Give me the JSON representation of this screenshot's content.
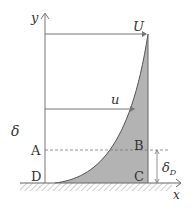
{
  "diagram": {
    "labels": {
      "y_axis": "y",
      "x_axis": "x",
      "free_stream_velocity": "U",
      "local_velocity": "u",
      "boundary_layer_thickness": "δ",
      "displacement_thickness": "δ",
      "displacement_thickness_subscript": "D",
      "point_a": "A",
      "point_b": "B",
      "point_c": "C",
      "point_d": "D"
    },
    "colors": {
      "line": "#777777",
      "fill": "#b0b0b0",
      "hatch": "#999999",
      "text": "#333333"
    }
  }
}
